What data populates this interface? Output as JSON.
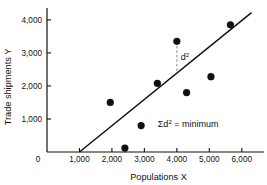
{
  "chart_data": {
    "type": "scatter",
    "title": "",
    "xlabel": "Populations X",
    "ylabel": "Trade shipments Y",
    "xlim": [
      0,
      6500
    ],
    "ylim": [
      0,
      4300
    ],
    "grid": false,
    "legend": "none",
    "x_ticks": [
      0,
      1000,
      2000,
      3000,
      4000,
      5000,
      6000
    ],
    "x_tick_labels": [
      "0",
      "1,000",
      "2,000",
      "3,000",
      "4,000",
      "5,000",
      "6,000"
    ],
    "y_ticks": [
      0,
      1000,
      2000,
      3000,
      4000
    ],
    "y_tick_labels": [
      "0",
      "1,000",
      "2,000",
      "3,000",
      "4,000"
    ],
    "points": [
      {
        "x": 1950,
        "y": 1500
      },
      {
        "x": 2400,
        "y": 120
      },
      {
        "x": 2900,
        "y": 800
      },
      {
        "x": 3400,
        "y": 2080
      },
      {
        "x": 4000,
        "y": 3350
      },
      {
        "x": 4300,
        "y": 1800
      },
      {
        "x": 5050,
        "y": 2280
      },
      {
        "x": 5650,
        "y": 3850
      }
    ],
    "point_color": "#111111",
    "point_size": 4.6,
    "regression_line": {
      "x_start": 1000,
      "y_start": 0,
      "x_end": 6300,
      "y_end": 4220,
      "color": "#111111"
    },
    "residual": {
      "x": 4000,
      "y_top": 3350,
      "y_bottom": 2390,
      "label": "d",
      "label_exponent": "2",
      "style": "dashed",
      "color": "#888888"
    },
    "annotation": {
      "sigma": "Σ",
      "base": "d",
      "exponent": "2",
      "tail": "= minimum",
      "x": 4350,
      "y": 760
    }
  }
}
